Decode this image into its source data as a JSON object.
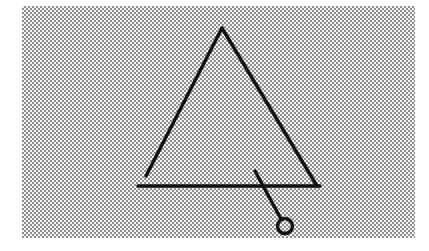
{
  "figure": {
    "medium": "scanned halftone line art",
    "canvas": {
      "width": 429,
      "height": 251,
      "page_background": "#ffffff"
    },
    "background_plate": {
      "name": "halftone-background",
      "x": 22,
      "y": 6,
      "width": 393,
      "height": 232,
      "tone_light": "#f2f2f2",
      "tone_dark": "#8f8f8f",
      "dot_period": 2
    },
    "ink_color": "#111111",
    "stroke_width": 3.4,
    "shapes": [
      {
        "name": "triangle-left-leg",
        "type": "line",
        "label": "Left leg of triangular frame",
        "x1": 222,
        "y1": 28,
        "x2": 146,
        "y2": 176
      },
      {
        "name": "triangle-right-leg",
        "type": "line",
        "label": "Right leg of triangular frame",
        "x1": 222,
        "y1": 28,
        "x2": 317,
        "y2": 186
      },
      {
        "name": "triangle-base-bar",
        "type": "line",
        "label": "Horizontal base bar",
        "x1": 138,
        "y1": 186,
        "x2": 320,
        "y2": 186
      },
      {
        "name": "pendulum-rod",
        "type": "line",
        "label": "Pendulum rod crossing the base bar",
        "x1": 255,
        "y1": 171,
        "x2": 281,
        "y2": 219
      },
      {
        "name": "pendulum-bob",
        "type": "circle",
        "label": "Circular pendulum bob",
        "cx": 285,
        "cy": 226,
        "r": 7.5
      }
    ],
    "apex_point": {
      "name": "triangle-apex",
      "x": 222,
      "y": 28
    }
  }
}
